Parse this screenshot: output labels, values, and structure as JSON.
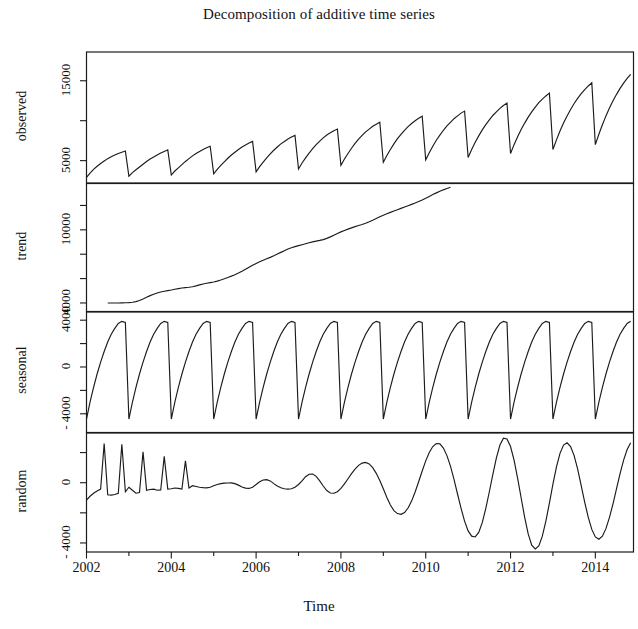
{
  "chart_data": {
    "type": "line",
    "title": "Decomposition of additive time series",
    "xlabel": "Time",
    "ylabel": "",
    "grid": false,
    "legend": "none",
    "xlim": [
      2002.0,
      2014.9
    ],
    "x_ticks": [
      2002,
      2004,
      2006,
      2008,
      2010,
      2012,
      2014
    ],
    "x_tick_labels": [
      "2002",
      "2004",
      "2006",
      "2008",
      "2010",
      "2012",
      "2014"
    ],
    "x_minor_ticks": [
      2003,
      2005,
      2007,
      2009,
      2011,
      2013
    ],
    "frequency": 12,
    "x_start": 2002.0,
    "x_end": 2014.9167,
    "panels": [
      {
        "name": "observed",
        "ylabel": "observed",
        "ylim": [
          2200,
          18600
        ],
        "y_ticks": [
          5000,
          10000,
          15000
        ],
        "y_tick_labels": [
          "5000",
          "",
          "15000"
        ],
        "y_labeled_ticks": [
          5000,
          15000
        ],
        "values": [
          2900,
          3450,
          3900,
          4300,
          4650,
          4950,
          5250,
          5500,
          5700,
          5900,
          6050,
          6200,
          3050,
          3500,
          3850,
          4200,
          4550,
          4900,
          5200,
          5450,
          5700,
          5950,
          6150,
          6350,
          3200,
          3700,
          4100,
          4500,
          4900,
          5250,
          5600,
          5900,
          6150,
          6400,
          6600,
          6800,
          3350,
          3900,
          4400,
          4850,
          5300,
          5700,
          6050,
          6400,
          6700,
          6950,
          7200,
          7400,
          3600,
          4250,
          4800,
          5350,
          5850,
          6300,
          6700,
          7100,
          7400,
          7700,
          7950,
          8150,
          3950,
          4700,
          5350,
          5950,
          6500,
          7000,
          7450,
          7850,
          8200,
          8500,
          8750,
          8950,
          4400,
          5200,
          5900,
          6550,
          7150,
          7700,
          8150,
          8600,
          8950,
          9300,
          9550,
          9800,
          4800,
          5650,
          6400,
          7100,
          7750,
          8300,
          8800,
          9250,
          9650,
          10000,
          10300,
          10550,
          5100,
          6000,
          6800,
          7550,
          8200,
          8800,
          9350,
          9800,
          10250,
          10600,
          10950,
          11200,
          5400,
          6400,
          7300,
          8100,
          8850,
          9500,
          10100,
          10650,
          11100,
          11550,
          11900,
          12200,
          5900,
          7000,
          8000,
          8900,
          9700,
          10450,
          11100,
          11700,
          12250,
          12700,
          13100,
          13450,
          6400,
          7600,
          8700,
          9700,
          10600,
          11400,
          12150,
          12800,
          13400,
          13900,
          14350,
          14750,
          7000,
          8300,
          9500,
          10600,
          11600,
          12500,
          13300,
          14050,
          14700,
          15300,
          15800,
          16250
        ]
      },
      {
        "name": "trend",
        "ylabel": "trend",
        "ylim": [
          3300,
          13800
        ],
        "y_ticks": [
          4000,
          6000,
          8000,
          10000,
          12000
        ],
        "y_tick_labels": [
          "4000",
          "",
          "",
          "10000",
          ""
        ],
        "y_labeled_ticks": [
          4000,
          10000
        ],
        "values": [
          4000,
          4000,
          4000,
          4000,
          4010,
          4020,
          4030,
          4060,
          4110,
          4200,
          4330,
          4470,
          4600,
          4720,
          4820,
          4900,
          4960,
          5010,
          5060,
          5120,
          5180,
          5230,
          5260,
          5290,
          5330,
          5400,
          5480,
          5560,
          5620,
          5670,
          5720,
          5790,
          5880,
          5980,
          6090,
          6200,
          6320,
          6450,
          6600,
          6760,
          6930,
          7090,
          7240,
          7380,
          7500,
          7620,
          7740,
          7870,
          8010,
          8150,
          8290,
          8420,
          8530,
          8620,
          8700,
          8780,
          8860,
          8940,
          9010,
          9070,
          9130,
          9200,
          9300,
          9420,
          9560,
          9700,
          9830,
          9950,
          10060,
          10160,
          10260,
          10350,
          10440,
          10540,
          10660,
          10790,
          10930,
          11070,
          11200,
          11320,
          11430,
          11540,
          11650,
          11760,
          11870,
          11980,
          12090,
          12200,
          12320,
          12450,
          12590,
          12740,
          12890,
          13030,
          13160,
          13280,
          13390,
          13490
        ]
      },
      {
        "name": "seasonal",
        "ylabel": "seasonal",
        "ylim": [
          -5600,
          4700
        ],
        "y_ticks": [
          -4000,
          -2000,
          0,
          2000,
          4000
        ],
        "y_tick_labels": [
          "- 4000",
          "",
          "0",
          "",
          "4000"
        ],
        "y_labeled_ticks": [
          -4000,
          0,
          4000
        ],
        "pattern": [
          -4450,
          -3000,
          -1750,
          -600,
          420,
          1320,
          2130,
          2800,
          3300,
          3720,
          3900,
          3800
        ],
        "period": 12,
        "amplitude_max": 3900,
        "amplitude_min": -4450
      },
      {
        "name": "random",
        "ylabel": "random",
        "ylim": [
          -4600,
          3300
        ],
        "y_ticks": [
          -4000,
          -2000,
          0,
          2000
        ],
        "y_tick_labels": [
          "- 4000",
          "",
          "0",
          ""
        ],
        "y_labeled_ticks": [
          -4000,
          0
        ],
        "values": [
          -1150,
          -900,
          -700,
          -550,
          -420,
          2600,
          -800,
          -820,
          -780,
          -700,
          2550,
          -600,
          -300,
          -500,
          -700,
          -650,
          2050,
          -500,
          -450,
          -430,
          -500,
          -480,
          1750,
          -420,
          -400,
          -350,
          -380,
          -420,
          1450,
          -350,
          -200,
          -250,
          -300,
          -330,
          -340,
          -300,
          -200,
          -120,
          -60,
          -30,
          -20,
          -10,
          -60,
          -160,
          -280,
          -360,
          -380,
          -300,
          -120,
          60,
          180,
          200,
          120,
          -60,
          -220,
          -330,
          -400,
          -430,
          -400,
          -300,
          -120,
          120,
          400,
          560,
          580,
          420,
          120,
          -220,
          -520,
          -680,
          -700,
          -600,
          -380,
          -80,
          260,
          600,
          900,
          1150,
          1300,
          1350,
          1250,
          1000,
          620,
          140,
          -400,
          -980,
          -1480,
          -1850,
          -2050,
          -2100,
          -1980,
          -1680,
          -1220,
          -620,
          60,
          780,
          1450,
          2000,
          2400,
          2600,
          2580,
          2300,
          1800,
          1100,
          220,
          -750,
          -1700,
          -2550,
          -3200,
          -3550,
          -3600,
          -3300,
          -2650,
          -1700,
          -600,
          560,
          1650,
          2500,
          2950,
          2900,
          2400,
          1500,
          300,
          -1000,
          -2300,
          -3400,
          -4150,
          -4400,
          -4200,
          -3550,
          -2550,
          -1350,
          -100,
          1050,
          1950,
          2500,
          2650,
          2400,
          1800,
          900,
          -200,
          -1300,
          -2300,
          -3100,
          -3600,
          -3750,
          -3550,
          -3050,
          -2300,
          -1400,
          -400,
          600,
          1500,
          2200,
          2650,
          2800,
          2650,
          2200,
          1450,
          450,
          -700,
          -4400
        ]
      }
    ]
  }
}
